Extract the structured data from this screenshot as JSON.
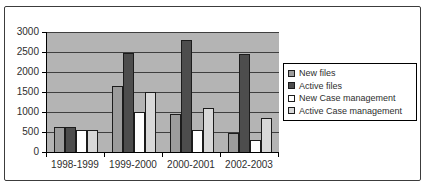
{
  "colors": {
    "frame_border": "#3c3c3c",
    "plot_background": "#b4b4b4",
    "gridline": "#3f3f3f",
    "axis": "#000000",
    "bar_border": "#1c1c1c",
    "legend_background": "#ffffff",
    "legend_border": "#000000",
    "text": "#2e2e2e"
  },
  "chart_data": {
    "type": "bar",
    "title": "",
    "xlabel": "",
    "ylabel": "",
    "categories": [
      "1998-1999",
      "1999-2000",
      "2000-2001",
      "2002-2003"
    ],
    "series": [
      {
        "name": "New files",
        "color": "#9c9c9c",
        "values": [
          630,
          1650,
          950,
          480
        ]
      },
      {
        "name": "Active files",
        "color": "#4d4d4d",
        "values": [
          630,
          2480,
          2800,
          2450
        ]
      },
      {
        "name": "New Case management",
        "color": "#ffffff",
        "values": [
          540,
          990,
          540,
          300
        ]
      },
      {
        "name": "Active Case management",
        "color": "#d8d8d8",
        "values": [
          540,
          1500,
          1100,
          840
        ]
      }
    ],
    "ylim": [
      0,
      3000
    ],
    "ytick_step": 500,
    "yticks": [
      0,
      500,
      1000,
      1500,
      2000,
      2500,
      3000
    ],
    "grid": "horizontal",
    "legend_position": "right"
  }
}
